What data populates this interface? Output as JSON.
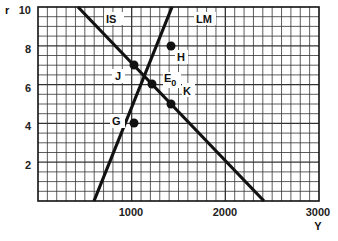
{
  "chart_data": {
    "type": "line",
    "title": "",
    "xlabel": "Y",
    "ylabel": "r",
    "xlim": [
      0,
      3000
    ],
    "ylim": [
      0,
      10
    ],
    "x_ticks": [
      1000,
      2000,
      3000
    ],
    "x_tick_labels": [
      "1000",
      "2000",
      "3000"
    ],
    "y_ticks": [
      2,
      4,
      6,
      8,
      10
    ],
    "y_tick_labels": [
      "2",
      "4",
      "6",
      "8",
      "10"
    ],
    "grid": true,
    "grid_minor_x_step": 100,
    "grid_minor_y_step": 0.5,
    "legend": "none",
    "series": [
      {
        "name": "IS",
        "x": [
          500,
          2400
        ],
        "y": [
          10,
          0
        ]
      },
      {
        "name": "LM",
        "x": [
          600,
          1600
        ],
        "y": [
          0,
          10
        ]
      }
    ],
    "points": [
      {
        "label": "J",
        "x": 1000,
        "y": 7
      },
      {
        "label": "H",
        "x": 1400,
        "y": 8
      },
      {
        "label": "E0",
        "x": 1200,
        "y": 6
      },
      {
        "label": "K",
        "x": 1400,
        "y": 5
      },
      {
        "label": "G",
        "x": 1000,
        "y": 4
      }
    ],
    "annotations": [
      "IS",
      "LM",
      "J",
      "H",
      "E0",
      "K",
      "G"
    ]
  },
  "labels": {
    "y_axis": "r",
    "x_axis": "Y",
    "curve_is": "IS",
    "curve_lm": "LM",
    "pt_j": "J",
    "pt_h": "H",
    "pt_e": "E",
    "pt_e_sub": "0",
    "pt_k": "K",
    "pt_g": "G",
    "x1": "1000",
    "x2": "2000",
    "x3": "3000",
    "y2": "2",
    "y4": "4",
    "y6": "6",
    "y8": "8",
    "y10": "10"
  }
}
